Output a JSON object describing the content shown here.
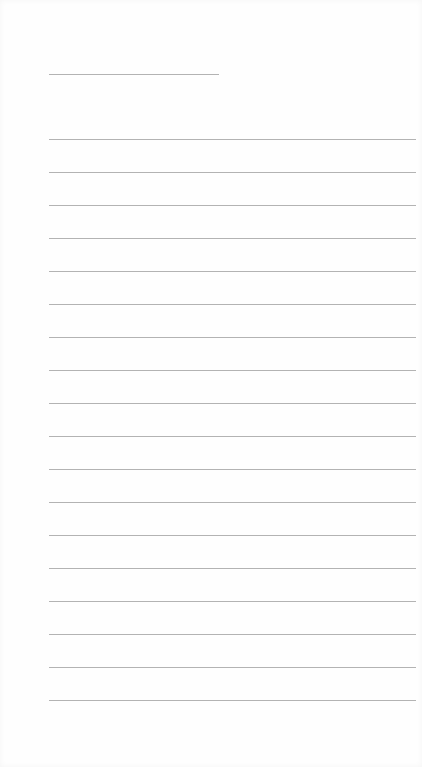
{
  "page": {
    "type": "blank lined paper",
    "header_line": {
      "label": ""
    },
    "ruled_lines": [
      {
        "index": 1,
        "text": ""
      },
      {
        "index": 2,
        "text": ""
      },
      {
        "index": 3,
        "text": ""
      },
      {
        "index": 4,
        "text": ""
      },
      {
        "index": 5,
        "text": ""
      },
      {
        "index": 6,
        "text": ""
      },
      {
        "index": 7,
        "text": ""
      },
      {
        "index": 8,
        "text": ""
      },
      {
        "index": 9,
        "text": ""
      },
      {
        "index": 10,
        "text": ""
      },
      {
        "index": 11,
        "text": ""
      },
      {
        "index": 12,
        "text": ""
      },
      {
        "index": 13,
        "text": ""
      },
      {
        "index": 14,
        "text": ""
      },
      {
        "index": 15,
        "text": ""
      },
      {
        "index": 16,
        "text": ""
      },
      {
        "index": 17,
        "text": ""
      },
      {
        "index": 18,
        "text": ""
      }
    ],
    "colors": {
      "background": "#fefefe",
      "line": "#b3b3b3"
    }
  }
}
